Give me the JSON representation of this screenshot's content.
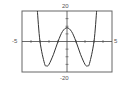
{
  "figure": {
    "part_label": ")"
  },
  "chart_data": {
    "type": "line",
    "title": "",
    "xlabel": "",
    "ylabel": "",
    "xlim": [
      -5,
      5
    ],
    "ylim": [
      -20,
      20
    ],
    "tick_labels": {
      "x_min": "-5",
      "x_max": "5",
      "y_max": "20",
      "y_min": "-20"
    },
    "x_ticks": [
      -4,
      -3,
      -2,
      -1,
      1,
      2,
      3,
      4
    ],
    "grid": false,
    "legend": null,
    "series": [
      {
        "name": "f(x)",
        "x": [
          -3.3,
          -3,
          -2.5,
          -2.24,
          -2,
          -1.5,
          -1,
          -0.5,
          0,
          0.5,
          1,
          1.5,
          2,
          2.24,
          2.5,
          3,
          3.3
        ],
        "values": [
          20.7,
          0,
          -14.4,
          -16,
          -15,
          -8.4,
          0,
          6.6,
          9,
          6.6,
          0,
          -8.4,
          -15,
          -16,
          -14.4,
          0,
          20.7
        ]
      }
    ],
    "annotations": {
      "local_max": [
        0,
        9
      ],
      "local_mins": [
        [
          -2.24,
          -16
        ],
        [
          2.24,
          -16
        ]
      ],
      "x_intercepts": [
        -3,
        -1,
        1,
        3
      ]
    },
    "colors": {
      "curve": "#333333",
      "frame": "#555555",
      "axes": "#444444"
    }
  }
}
